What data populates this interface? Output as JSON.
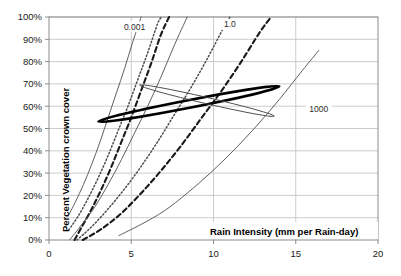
{
  "chart_data": {
    "type": "line",
    "title": "",
    "xlabel": "Rain Intensity (mm per Rain-day)",
    "ylabel": "Percent Vegetation crown cover",
    "xlim": [
      0,
      20
    ],
    "ylim": [
      0,
      100
    ],
    "grid": true,
    "legend": "none",
    "xticks": [
      "0",
      "5",
      "10",
      "15",
      "20"
    ],
    "xtick_values": [
      0,
      5,
      10,
      15,
      20
    ],
    "yticks": [
      "0%",
      "10%",
      "20%",
      "30%",
      "40%",
      "50%",
      "60%",
      "70%",
      "80%",
      "90%",
      "100%"
    ],
    "ytick_values": [
      0,
      10,
      20,
      30,
      40,
      50,
      60,
      70,
      80,
      90,
      100
    ],
    "annotations": [
      {
        "text": "0.001",
        "x": 5.2,
        "y": 95,
        "name": "curve-label-0001"
      },
      {
        "text": "1.0",
        "x": 11.0,
        "y": 96,
        "name": "curve-label-10"
      },
      {
        "text": "1000",
        "x": 16.4,
        "y": 58,
        "name": "curve-label-1000"
      }
    ],
    "series": [
      {
        "name": "0.001",
        "style": "solid-thin",
        "points": [
          [
            1.15,
            10.5
          ],
          [
            1.6,
            17
          ],
          [
            2.1,
            25
          ],
          [
            2.6,
            34
          ],
          [
            3.1,
            44
          ],
          [
            3.6,
            55
          ],
          [
            4.1,
            66
          ],
          [
            4.6,
            77
          ],
          [
            5.1,
            89
          ],
          [
            5.6,
            100
          ]
        ]
      },
      {
        "name": "0.01",
        "style": "dotted",
        "points": [
          [
            1.2,
            4.5
          ],
          [
            1.8,
            11
          ],
          [
            2.4,
            19
          ],
          [
            3.0,
            28
          ],
          [
            3.6,
            38
          ],
          [
            4.2,
            49
          ],
          [
            4.8,
            60
          ],
          [
            5.4,
            72
          ],
          [
            6.0,
            84
          ],
          [
            6.6,
            97
          ],
          [
            6.85,
            100
          ]
        ]
      },
      {
        "name": "0.1",
        "style": "dashed-thick",
        "points": [
          [
            1.55,
            0
          ],
          [
            2.0,
            6
          ],
          [
            2.6,
            14
          ],
          [
            3.2,
            23
          ],
          [
            3.8,
            33
          ],
          [
            4.4,
            44
          ],
          [
            5.0,
            55
          ],
          [
            5.6,
            67
          ],
          [
            6.2,
            79
          ],
          [
            6.8,
            92
          ],
          [
            7.3,
            100
          ]
        ]
      },
      {
        "name": "1.0",
        "style": "solid-thin",
        "points": [
          [
            1.25,
            0
          ],
          [
            2.0,
            7
          ],
          [
            2.8,
            15
          ],
          [
            3.6,
            25
          ],
          [
            4.4,
            36
          ],
          [
            5.2,
            48
          ],
          [
            6.0,
            60
          ],
          [
            6.8,
            73
          ],
          [
            7.6,
            87
          ],
          [
            8.4,
            100
          ]
        ]
      },
      {
        "name": "10",
        "style": "dotted",
        "points": [
          [
            1.7,
            0
          ],
          [
            2.6,
            6
          ],
          [
            3.6,
            14
          ],
          [
            4.6,
            23
          ],
          [
            5.6,
            33
          ],
          [
            6.6,
            44
          ],
          [
            7.6,
            56
          ],
          [
            8.6,
            68
          ],
          [
            9.6,
            81
          ],
          [
            10.6,
            95
          ],
          [
            11.0,
            100
          ]
        ]
      },
      {
        "name": "100",
        "style": "dashed-thick",
        "points": [
          [
            2.05,
            0
          ],
          [
            3.2,
            5
          ],
          [
            4.4,
            12
          ],
          [
            5.6,
            21
          ],
          [
            6.8,
            31
          ],
          [
            8.0,
            42
          ],
          [
            9.2,
            54
          ],
          [
            10.4,
            66
          ],
          [
            11.6,
            79
          ],
          [
            12.8,
            93
          ],
          [
            13.5,
            100
          ]
        ]
      },
      {
        "name": "1000",
        "style": "solid-thin",
        "points": [
          [
            4.25,
            2
          ],
          [
            5.6,
            7
          ],
          [
            7.0,
            13
          ],
          [
            8.4,
            21
          ],
          [
            9.8,
            30
          ],
          [
            11.2,
            40
          ],
          [
            12.6,
            51
          ],
          [
            14.0,
            63
          ],
          [
            15.4,
            76
          ],
          [
            16.4,
            85
          ]
        ]
      }
    ],
    "ellipses": [
      {
        "name": "envelope-bold",
        "style": "thick",
        "cx": 8.5,
        "cy": 61,
        "rx": 5.6,
        "ry": 1.7,
        "rotation": -11
      },
      {
        "name": "envelope-thin",
        "style": "thin",
        "cx": 9.6,
        "cy": 62.5,
        "rx": 4.2,
        "ry": 1.4,
        "rotation": 13
      }
    ]
  },
  "plot": {
    "frame_color": "#8c8c8c",
    "grid_color": "#bfbfbf",
    "curve_color": "#4d4d4d",
    "bold_color": "#000000",
    "background": "#ffffff"
  }
}
